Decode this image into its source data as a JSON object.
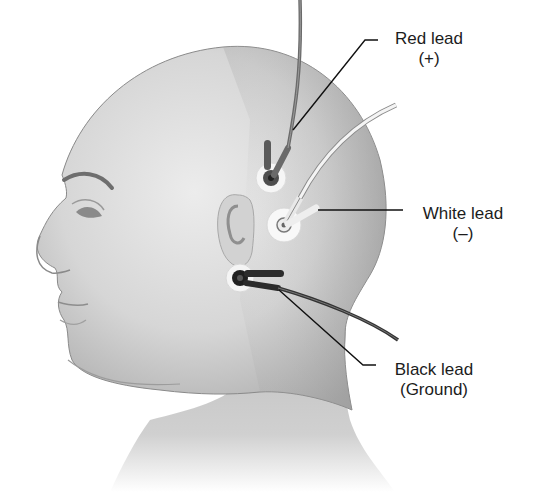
{
  "figure": {
    "colors": {
      "skin_light": "#e4e4e4",
      "skin_mid": "#c9c9c9",
      "skin_dark": "#9a9a9a",
      "red_lead": "#6a6a6a",
      "white_lead": "#f2f2f2",
      "black_lead": "#2a2a2a",
      "leader_line": "#111111",
      "text": "#1c1c1c"
    }
  },
  "labels": [
    {
      "id": "red",
      "title": "Red lead",
      "polarity": "(+)"
    },
    {
      "id": "white",
      "title": "White lead",
      "polarity": "(–)"
    },
    {
      "id": "black",
      "title": "Black lead",
      "polarity": "(Ground)"
    }
  ]
}
